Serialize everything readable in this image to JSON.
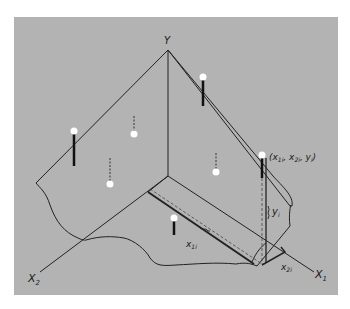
{
  "diagram": {
    "type": "3d-regression-plane",
    "background_color": "#b3b3b3",
    "axes": {
      "y": {
        "label": "Y"
      },
      "x1": {
        "label": "X",
        "subscript": "1"
      },
      "x2": {
        "label": "X",
        "subscript": "2"
      }
    },
    "annotations": {
      "point_label": "(x",
      "point_label_parts": [
        "(x",
        "1i",
        ", x",
        "2i",
        ", y",
        "i",
        ")"
      ],
      "x1i": {
        "base": "x",
        "sub": "1i"
      },
      "x2i": {
        "base": "x",
        "sub": "2i"
      },
      "yi": {
        "base": "y",
        "sub": "i"
      }
    },
    "points": [
      {
        "id": "p1",
        "x": 74,
        "y": 131,
        "residual": "solid-below"
      },
      {
        "id": "p2",
        "x": 134,
        "y": 134,
        "residual": "dashed-above"
      },
      {
        "id": "p3",
        "x": 110,
        "y": 184,
        "residual": "dashed-above"
      },
      {
        "id": "p4",
        "x": 203,
        "y": 77,
        "residual": "solid-below"
      },
      {
        "id": "p5",
        "x": 216,
        "y": 172,
        "residual": "dashed-above"
      },
      {
        "id": "p6",
        "x": 262,
        "y": 155,
        "residual": "solid-below"
      },
      {
        "id": "p7",
        "x": 174,
        "y": 218,
        "residual": "solid-below"
      }
    ]
  }
}
